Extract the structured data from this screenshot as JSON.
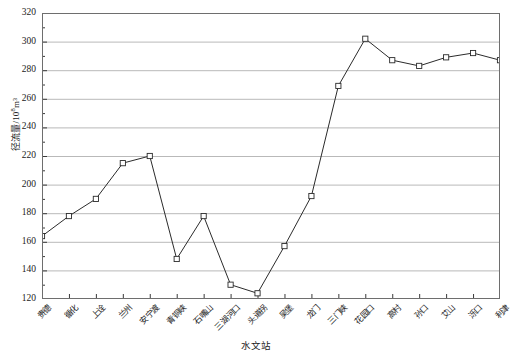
{
  "chart_data": {
    "type": "line",
    "title": "",
    "xlabel": "水文站",
    "ylabel": "径流量/10⁸m³",
    "ylabel_base": "径流量/10",
    "ylabel_exp": "8",
    "ylabel_tail": "m³",
    "ylim": [
      120,
      320
    ],
    "ytick_step": 20,
    "yticks": [
      320,
      300,
      280,
      260,
      240,
      220,
      200,
      180,
      160,
      140,
      120
    ],
    "grid": true,
    "legend": "none",
    "marker": "open-square",
    "line_color": "#2b2b2b",
    "grid_color": "#b9b9b9",
    "axis_color": "#6e6e6e",
    "marker_fill": "#ffffff",
    "categories": [
      "贵德",
      "循化",
      "上诠",
      "兰州",
      "安宁渡",
      "青铜峡",
      "石嘴山",
      "三湖河口",
      "头道拐",
      "吴堡",
      "龙门",
      "三门峡",
      "花园口",
      "高村",
      "孙口",
      "艾山",
      "泺口",
      "利津"
    ],
    "points": [
      {
        "station": "贵德",
        "value": 164
      },
      {
        "station": "循化",
        "value": 178
      },
      {
        "station": "上诠",
        "value": 190
      },
      {
        "station": "兰州",
        "value": 215
      },
      {
        "station": "安宁渡",
        "value": 220
      },
      {
        "station": "青铜峡",
        "value": 148
      },
      {
        "station": "石嘴山",
        "value": 178
      },
      {
        "station": "三湖河口",
        "value": 130
      },
      {
        "station": "头道拐",
        "value": 124
      },
      {
        "station": "吴堡",
        "value": 157
      },
      {
        "station": "龙门",
        "value": 192
      },
      {
        "station": "三门峡",
        "value": 269
      },
      {
        "station": "花园口",
        "value": 302
      },
      {
        "station": "高村",
        "value": 287
      },
      {
        "station": "孙口",
        "value": 283
      },
      {
        "station": "艾山",
        "value": 289
      },
      {
        "station": "泺口",
        "value": 292
      },
      {
        "station": "利津",
        "value": 287
      }
    ],
    "values": [
      164,
      178,
      190,
      215,
      220,
      148,
      178,
      130,
      124,
      157,
      192,
      269,
      302,
      287,
      283,
      289,
      292,
      287
    ]
  }
}
